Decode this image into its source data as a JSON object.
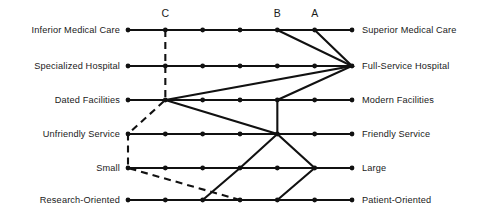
{
  "chart_data": {
    "type": "line",
    "title": "",
    "xlabel": "",
    "ylabel": "",
    "grid": false,
    "legend_position": "top",
    "scale_points": 7,
    "x": [
      1,
      2,
      3,
      4,
      5,
      6,
      7
    ],
    "categories": [
      "Medical Care",
      "Hospital Type",
      "Facilities",
      "Service",
      "Size",
      "Orientation"
    ],
    "left_labels": [
      "Inferior Medical Care",
      "Specialized Hospital",
      "Dated Facilities",
      "Unfriendly Service",
      "Small",
      "Research-Oriented"
    ],
    "right_labels": [
      "Superior Medical Care",
      "Full-Service Hospital",
      "Modern Facilities",
      "Friendly Service",
      "Large",
      "Patient-Oriented"
    ],
    "series": [
      {
        "name": "A",
        "values": [
          6,
          7,
          5,
          5,
          6,
          5
        ]
      },
      {
        "name": "B",
        "values": [
          5,
          7,
          2,
          5,
          4,
          3
        ]
      },
      {
        "name": "C",
        "values": [
          2,
          2,
          2,
          1,
          1,
          4
        ]
      }
    ],
    "profile_markers": [
      {
        "label": "A",
        "position": 6
      },
      {
        "label": "B",
        "position": 5
      },
      {
        "label": "C",
        "position": 2
      }
    ],
    "series_styles": [
      {
        "name": "A",
        "style": "solid"
      },
      {
        "name": "B",
        "style": "solid"
      },
      {
        "name": "C",
        "style": "dashed"
      }
    ]
  },
  "colors": {
    "ink": "#111111",
    "background": "#ffffff"
  }
}
